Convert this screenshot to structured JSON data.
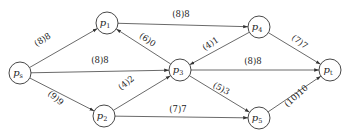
{
  "diagram": {
    "type": "network-flow",
    "nodes": [
      {
        "id": "s",
        "label": "p",
        "sub": "s",
        "x": 20,
        "y": 73
      },
      {
        "id": "1",
        "label": "p",
        "sub": "1",
        "x": 107,
        "y": 23
      },
      {
        "id": "2",
        "label": "p",
        "sub": "2",
        "x": 104,
        "y": 116
      },
      {
        "id": "3",
        "label": "p",
        "sub": "3",
        "x": 180,
        "y": 70
      },
      {
        "id": "4",
        "label": "p",
        "sub": "4",
        "x": 259,
        "y": 27
      },
      {
        "id": "5",
        "label": "p",
        "sub": "5",
        "x": 259,
        "y": 118
      },
      {
        "id": "t",
        "label": "p",
        "sub": "t",
        "x": 330,
        "y": 70
      }
    ],
    "edges": [
      {
        "from": "s",
        "to": "1",
        "label": "(8)8",
        "lx": 44,
        "ly": 42,
        "rot": -32
      },
      {
        "from": "s",
        "to": "3",
        "label": "(8)8",
        "lx": 100,
        "ly": 63,
        "rot": 0
      },
      {
        "from": "s",
        "to": "2",
        "label": "(9)9",
        "lx": 54,
        "ly": 100,
        "rot": 40
      },
      {
        "from": "3",
        "to": "1",
        "label": "(6)0",
        "lx": 146,
        "ly": 42,
        "rot": 35
      },
      {
        "from": "1",
        "to": "4",
        "label": "(8)8",
        "lx": 181,
        "ly": 17,
        "rot": 0
      },
      {
        "from": "2",
        "to": "3",
        "label": "(4)2",
        "lx": 128,
        "ly": 85,
        "rot": -38
      },
      {
        "from": "4",
        "to": "3",
        "label": "(4)1",
        "lx": 212,
        "ly": 46,
        "rot": -33
      },
      {
        "from": "3",
        "to": "t",
        "label": "(8)8",
        "lx": 253,
        "ly": 64,
        "rot": 0
      },
      {
        "from": "3",
        "to": "5",
        "label": "(5)3",
        "lx": 220,
        "ly": 91,
        "rot": 28
      },
      {
        "from": "2",
        "to": "5",
        "label": "(7)7",
        "lx": 178,
        "ly": 112,
        "rot": 0
      },
      {
        "from": "4",
        "to": "t",
        "label": "(7)7",
        "lx": 298,
        "ly": 44,
        "rot": 37
      },
      {
        "from": "5",
        "to": "t",
        "label": "(10)10",
        "lx": 298,
        "ly": 98,
        "rot": -42
      }
    ]
  }
}
